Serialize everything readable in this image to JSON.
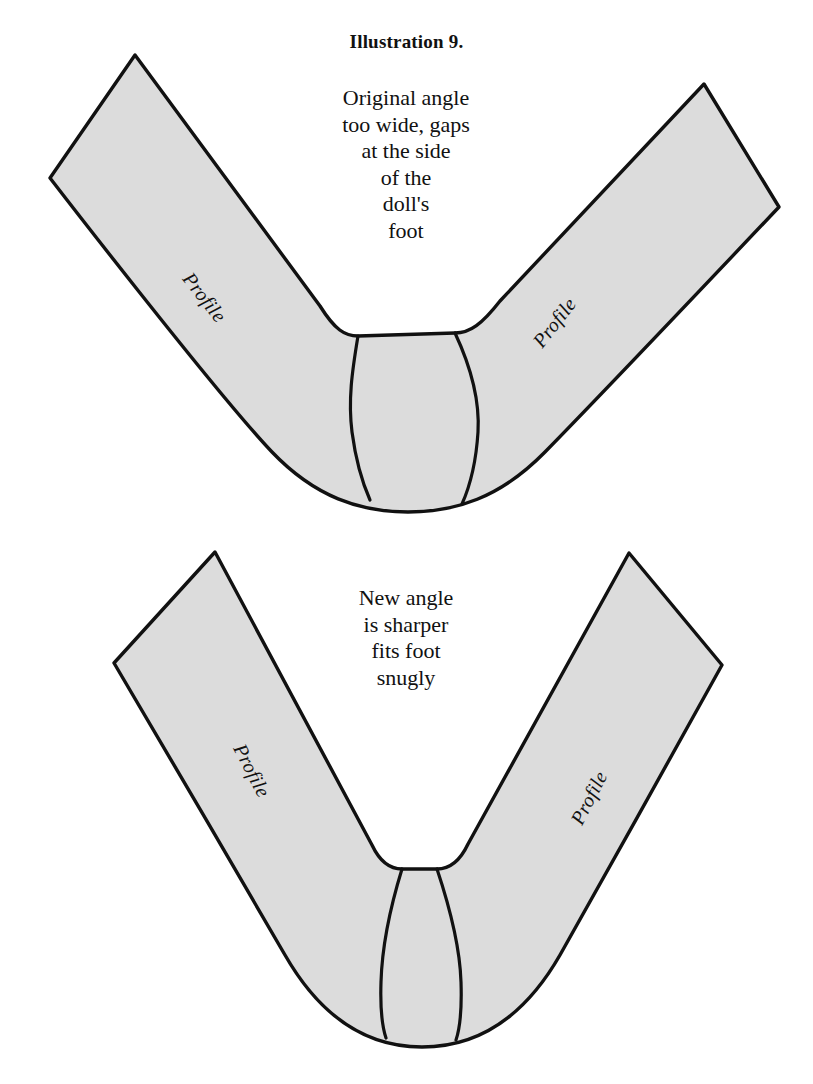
{
  "page": {
    "title": "Illustration 9.",
    "background_color": "#ffffff",
    "ink_color": "#111111",
    "shape_fill_color": "#dcdcdc",
    "shape_stroke_color": "#111111"
  },
  "figures": [
    {
      "id": "top-figure",
      "name": "original-angle-pattern",
      "caption": "Original angle\ntoo wide, gaps\nat the side\nof the\ndoll's\nfoot",
      "labels": {
        "left": "Profile",
        "right": "Profile"
      }
    },
    {
      "id": "bottom-figure",
      "name": "new-angle-pattern",
      "caption": "New angle\nis sharper\nfits foot\nsnugly",
      "labels": {
        "left": "Profile",
        "right": "Profile"
      }
    }
  ]
}
